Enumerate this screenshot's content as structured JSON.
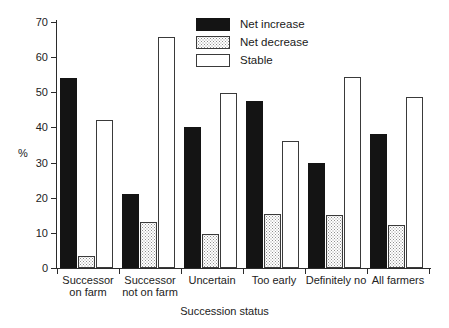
{
  "chart_data": {
    "type": "bar",
    "title": "",
    "xlabel": "Succession status",
    "ylabel": "%",
    "ylim": [
      0,
      70
    ],
    "yticks": [
      0,
      10,
      20,
      30,
      40,
      50,
      60,
      70
    ],
    "grid": false,
    "legend_position": "top-center",
    "categories": [
      "Successor\non farm",
      "Successor\nnot on farm",
      "Uncertain",
      "Too early",
      "Definitely no",
      "All farmers"
    ],
    "series": [
      {
        "name": "Net increase",
        "color": "#141414",
        "fill": "solid",
        "values": [
          54.0,
          21.0,
          40.0,
          47.5,
          29.8,
          38.0
        ]
      },
      {
        "name": "Net decrease",
        "color": "#8f8f8f",
        "fill": "stipple",
        "values": [
          3.4,
          13.1,
          9.7,
          15.3,
          15.0,
          12.2
        ]
      },
      {
        "name": "Stable",
        "color": "#ffffff",
        "fill": "open",
        "values": [
          42.1,
          65.8,
          49.8,
          36.1,
          54.4,
          48.8
        ]
      }
    ]
  },
  "axes": {
    "y_title": "%",
    "x_title": "Succession status",
    "y_tick_labels": [
      "70",
      "60",
      "50",
      "40",
      "30",
      "20",
      "10",
      "0"
    ]
  },
  "legend": {
    "items": [
      {
        "label": "Net increase",
        "swatch": "solid-black-swatch"
      },
      {
        "label": "Net decrease",
        "swatch": "stippled-grey-swatch"
      },
      {
        "label": "Stable",
        "swatch": "open-white-swatch"
      }
    ]
  }
}
